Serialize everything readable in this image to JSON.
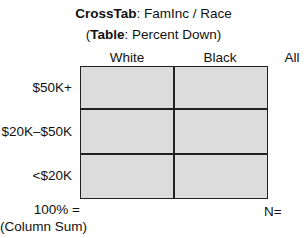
{
  "title": {
    "bold": "CrossTab",
    "rest": ": FamInc / Race"
  },
  "subtitle": {
    "open": "(",
    "bold": "Table",
    "rest": ": Percent Down)"
  },
  "columns": [
    "White",
    "Black",
    "All"
  ],
  "rows": [
    "$50K+",
    "$20K–$50K",
    "<$20K"
  ],
  "footer": {
    "sum_line1": "100% =",
    "sum_line2": "(Column Sum)",
    "n_label": "N="
  },
  "colors": {
    "cell_fill": "#dcdcdc",
    "grid_line": "#222222"
  }
}
